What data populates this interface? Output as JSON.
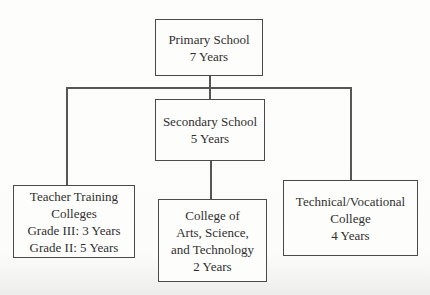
{
  "figure": {
    "kind": "education-system-flowchart",
    "background_color": "#fdfdfc",
    "box_border_color": "#4a4a4a",
    "line_color": "#565656",
    "text_color": "#2f2f2f"
  },
  "nodes": {
    "primary": {
      "lines": [
        "Primary School",
        "7 Years"
      ]
    },
    "secondary": {
      "lines": [
        "Secondary School",
        "5 Years"
      ]
    },
    "teacher": {
      "lines": [
        "Teacher Training",
        "Colleges",
        "Grade III: 3 Years",
        "Grade II: 5 Years"
      ]
    },
    "arts": {
      "lines": [
        "College of",
        "Arts, Science,",
        "and Technology",
        "2 Years"
      ]
    },
    "technical": {
      "lines": [
        "Technical/Vocational",
        "College",
        "4 Years"
      ]
    }
  },
  "edges": [
    {
      "from": "primary",
      "to": "secondary"
    },
    {
      "from": "primary",
      "to": "teacher"
    },
    {
      "from": "primary",
      "to": "technical"
    },
    {
      "from": "secondary",
      "to": "arts"
    }
  ]
}
